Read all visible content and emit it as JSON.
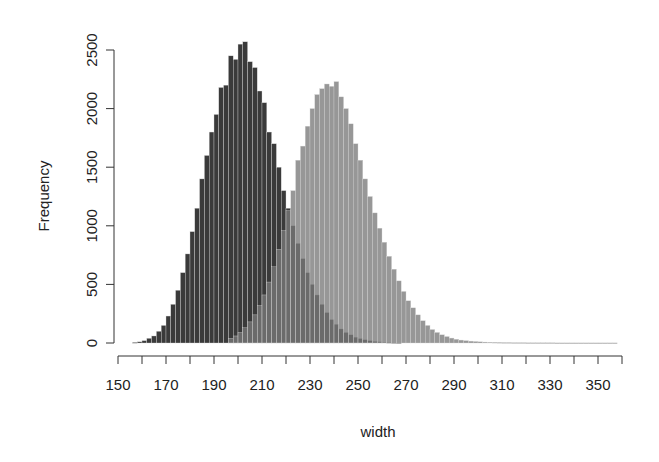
{
  "chart_data": {
    "type": "bar",
    "subtype": "overlapping-histogram",
    "title": "",
    "xlabel": "width",
    "ylabel": "Frequency",
    "xlim": [
      150,
      360
    ],
    "ylim": [
      0,
      2500
    ],
    "x_ticks": [
      150,
      160,
      170,
      180,
      190,
      200,
      210,
      220,
      230,
      240,
      250,
      260,
      270,
      280,
      290,
      300,
      310,
      320,
      330,
      340,
      350,
      360
    ],
    "x_tick_labels": [
      "150",
      "170",
      "190",
      "210",
      "230",
      "250",
      "270",
      "290",
      "310",
      "330",
      "350"
    ],
    "x_tick_label_values": [
      150,
      170,
      190,
      210,
      230,
      250,
      270,
      290,
      310,
      330,
      350
    ],
    "y_ticks": [
      0,
      500,
      1000,
      1500,
      2000,
      2500
    ],
    "y_tick_labels": [
      "0",
      "500",
      "1000",
      "1500",
      "2000",
      "2500"
    ],
    "grid": false,
    "legend": null,
    "bin_width": 2,
    "series": [
      {
        "name": "group 1 (dark)",
        "color": "#3a3a3a",
        "opacity": 1.0,
        "bin_starts": [
          156,
          158,
          160,
          162,
          164,
          166,
          168,
          170,
          172,
          174,
          176,
          178,
          180,
          182,
          184,
          186,
          188,
          190,
          192,
          194,
          196,
          198,
          200,
          202,
          204,
          206,
          208,
          210,
          212,
          214,
          216,
          218,
          220,
          222,
          224,
          226,
          228,
          230,
          232,
          234,
          236,
          238,
          240,
          242,
          244,
          246,
          248,
          250,
          252,
          254,
          256,
          258,
          260,
          262,
          264,
          266
        ],
        "values": [
          5,
          10,
          20,
          40,
          60,
          100,
          150,
          230,
          330,
          450,
          600,
          760,
          950,
          1150,
          1400,
          1600,
          1800,
          1950,
          2180,
          2200,
          2450,
          2420,
          2550,
          2570,
          2400,
          2350,
          2150,
          2050,
          1800,
          1700,
          1500,
          1300,
          1150,
          1000,
          850,
          720,
          600,
          500,
          410,
          330,
          260,
          200,
          160,
          120,
          90,
          70,
          50,
          38,
          28,
          20,
          14,
          10,
          7,
          5,
          3,
          2
        ]
      },
      {
        "name": "group 2 (light)",
        "color": "#7a7a7a",
        "opacity": 0.78,
        "bin_starts": [
          196,
          198,
          200,
          202,
          204,
          206,
          208,
          210,
          212,
          214,
          216,
          218,
          220,
          222,
          224,
          226,
          228,
          230,
          232,
          234,
          236,
          238,
          240,
          242,
          244,
          246,
          248,
          250,
          252,
          254,
          256,
          258,
          260,
          262,
          264,
          266,
          268,
          270,
          272,
          274,
          276,
          278,
          280,
          282,
          284,
          286,
          288,
          290,
          292,
          294,
          296,
          298,
          300,
          302,
          304,
          306,
          308,
          310,
          312,
          314,
          316,
          318,
          320,
          322,
          324,
          326,
          328,
          330,
          332,
          334,
          336,
          338,
          340,
          342,
          344,
          346,
          348,
          350,
          352,
          354,
          356
        ],
        "values": [
          40,
          60,
          90,
          130,
          180,
          240,
          320,
          410,
          520,
          650,
          800,
          960,
          1130,
          1300,
          1560,
          1680,
          1850,
          2000,
          2120,
          2170,
          2210,
          2190,
          2230,
          2100,
          2000,
          1870,
          1700,
          1560,
          1400,
          1250,
          1110,
          980,
          860,
          740,
          630,
          530,
          440,
          360,
          300,
          240,
          190,
          150,
          115,
          90,
          70,
          55,
          42,
          32,
          25,
          20,
          16,
          13,
          10,
          8,
          7,
          6,
          5,
          4,
          4,
          3,
          3,
          3,
          2,
          2,
          2,
          2,
          2,
          2,
          1,
          1,
          1,
          1,
          1,
          1,
          1,
          1,
          1,
          1,
          1,
          1,
          1
        ]
      }
    ]
  }
}
